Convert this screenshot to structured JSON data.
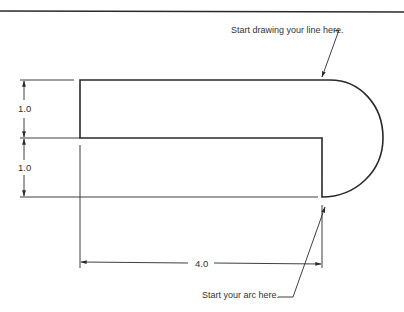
{
  "annotations": {
    "start_line": "Start drawing your line here.",
    "start_arc": "Start your arc here."
  },
  "dimensions": {
    "upper_height": "1.0",
    "lower_height": "1.0",
    "length": "4.0"
  },
  "colors": {
    "line": "#2a2a2a",
    "background": "#ffffff"
  }
}
